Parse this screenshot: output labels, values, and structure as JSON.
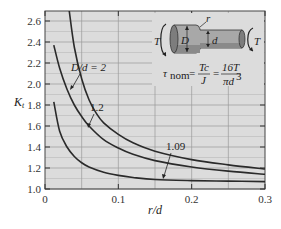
{
  "chart_data": {
    "type": "line",
    "title": "",
    "xlabel": "r/d",
    "ylabel": "K_t",
    "xlim": [
      0,
      0.3
    ],
    "ylim": [
      1.0,
      2.7
    ],
    "x_ticks": [
      "0",
      "0.1",
      "0.2",
      "0.3"
    ],
    "y_ticks": [
      "1.0",
      "1.2",
      "1.4",
      "1.6",
      "1.8",
      "2.0",
      "2.2",
      "2.4",
      "2.6"
    ],
    "grid": true,
    "legend": "inline annotations",
    "series": [
      {
        "name": "D/d = 2",
        "x": [
          0.033,
          0.04,
          0.05,
          0.06,
          0.07,
          0.08,
          0.1,
          0.12,
          0.15,
          0.2,
          0.25,
          0.3
        ],
        "y": [
          2.7,
          2.35,
          2.05,
          1.85,
          1.72,
          1.63,
          1.52,
          1.44,
          1.36,
          1.28,
          1.23,
          1.19
        ]
      },
      {
        "name": "1.2",
        "x": [
          0.012,
          0.02,
          0.03,
          0.04,
          0.05,
          0.06,
          0.08,
          0.1,
          0.12,
          0.15,
          0.2,
          0.25,
          0.3
        ],
        "y": [
          2.37,
          2.15,
          1.95,
          1.8,
          1.69,
          1.6,
          1.47,
          1.39,
          1.33,
          1.27,
          1.21,
          1.17,
          1.14
        ]
      },
      {
        "name": "1.09",
        "x": [
          0.012,
          0.02,
          0.03,
          0.04,
          0.05,
          0.06,
          0.08,
          0.1,
          0.12,
          0.15,
          0.2,
          0.25,
          0.3
        ],
        "y": [
          1.83,
          1.55,
          1.4,
          1.31,
          1.25,
          1.21,
          1.16,
          1.13,
          1.11,
          1.09,
          1.08,
          1.075,
          1.07
        ]
      }
    ],
    "annotations": [
      "D/d = 2",
      "1.2",
      "1.09"
    ],
    "inset": {
      "torque_left": "T",
      "torque_right": "T",
      "dim_D": "D",
      "dim_d": "d",
      "dim_r": "r",
      "formula_lhs": "τ",
      "formula_sub": "nom",
      "formula_eq1_num": "Tc",
      "formula_eq1_den": "J",
      "formula_eq2_num": "16T",
      "formula_eq2_den": "πd",
      "formula_eq2_den_exp": "3"
    }
  },
  "colors": {
    "plot_bg": "#dcdcdc",
    "grid_major": "#9a9a9a",
    "grid_minor": "#b8b8b8",
    "curve": "#2a2a2a",
    "shaft_fill": "#a8a8a8",
    "shaft_shadow": "#7d7d7d"
  }
}
